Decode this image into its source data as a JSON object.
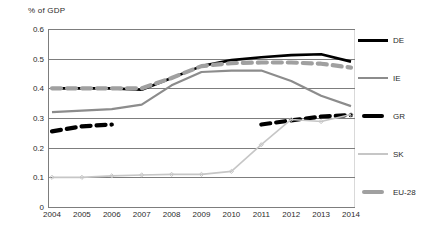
{
  "chart_data": {
    "type": "line",
    "title": "",
    "subtitle": "",
    "xlabel": "",
    "ylabel": "% of GDP",
    "categories": [
      "2004",
      "2005",
      "2006",
      "2007",
      "2008",
      "2009",
      "2010",
      "2011",
      "2012",
      "2013",
      "2014"
    ],
    "x": [
      2004,
      2005,
      2006,
      2007,
      2008,
      2009,
      2010,
      2011,
      2012,
      2013,
      2014
    ],
    "ylim": [
      0,
      0.6
    ],
    "yticks": [
      "0",
      "0.1",
      "0.2",
      "0.3",
      "0.4",
      "0.5",
      "0.6"
    ],
    "ytick_values": [
      0,
      0.1,
      0.2,
      0.3,
      0.4,
      0.5,
      0.6
    ],
    "grid": true,
    "legend_position": "right",
    "series": [
      {
        "name": "DE",
        "color": "#000000",
        "style": "solid",
        "width": 2.6,
        "values": [
          0.4,
          0.4,
          0.4,
          0.395,
          0.435,
          0.475,
          0.495,
          0.505,
          0.512,
          0.515,
          0.49
        ]
      },
      {
        "name": "IE",
        "color": "#8c8c8c",
        "style": "solid",
        "width": 2.2,
        "values": [
          0.32,
          0.325,
          0.33,
          0.345,
          0.41,
          0.455,
          0.46,
          0.46,
          0.425,
          0.375,
          0.34
        ]
      },
      {
        "name": "GR",
        "color": "#000000",
        "style": "dashed",
        "width": 4.2,
        "values": [
          0.255,
          0.272,
          0.278,
          null,
          null,
          null,
          null,
          0.278,
          0.292,
          0.305,
          0.31
        ]
      },
      {
        "name": "SK",
        "color": "#c6c6c6",
        "style": "solid-marker",
        "width": 1.6,
        "values": [
          0.1,
          0.1,
          0.105,
          0.108,
          0.11,
          0.11,
          0.12,
          0.21,
          0.295,
          0.288,
          0.312
        ]
      },
      {
        "name": "EU-28",
        "color": "#a0a0a0",
        "style": "dashed",
        "width": 4.2,
        "values": [
          0.4,
          0.4,
          0.4,
          0.4,
          0.435,
          0.475,
          0.485,
          0.487,
          0.487,
          0.483,
          0.47
        ]
      }
    ]
  },
  "legend": {
    "items": [
      {
        "label": "DE"
      },
      {
        "label": "IE"
      },
      {
        "label": "GR"
      },
      {
        "label": "SK"
      },
      {
        "label": "EU-28"
      }
    ]
  }
}
